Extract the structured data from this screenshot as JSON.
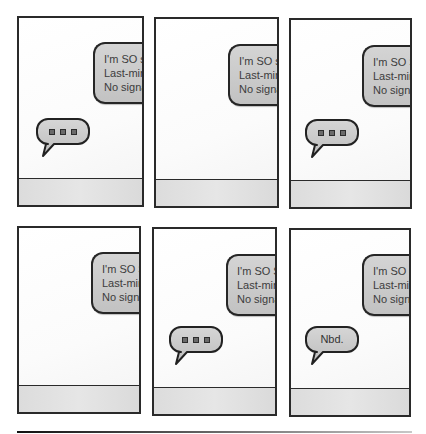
{
  "comic": {
    "panels": [
      {
        "id": 1,
        "incoming_message": [
          "I'm SO s",
          "Last-min",
          "No signa"
        ],
        "reply": {
          "type": "typing",
          "text": ""
        }
      },
      {
        "id": 2,
        "incoming_message": [
          "I'm SO s",
          "Last-min",
          "No signa"
        ],
        "reply": null
      },
      {
        "id": 3,
        "incoming_message": [
          "I'm SO S",
          "Last-min",
          "No signa"
        ],
        "reply": {
          "type": "typing",
          "text": ""
        }
      },
      {
        "id": 4,
        "incoming_message": [
          "I'm SO S",
          "Last-min",
          "No signa"
        ],
        "reply": null
      },
      {
        "id": 5,
        "incoming_message": [
          "I'm SO S",
          "Last-min",
          "No signa"
        ],
        "reply": {
          "type": "typing",
          "text": ""
        }
      },
      {
        "id": 6,
        "incoming_message": [
          "I'm SO S",
          "Last-min",
          "No signa"
        ],
        "reply": {
          "type": "text",
          "text": "Nbd."
        }
      }
    ]
  },
  "icons": {
    "typing_indicator": "typing-dots-icon",
    "speech_bubble": "speech-bubble-icon"
  },
  "colors": {
    "border": "#2a2a2a",
    "bubble_fill": "#c8c8c8",
    "footer_fill": "#e0e0e0"
  }
}
